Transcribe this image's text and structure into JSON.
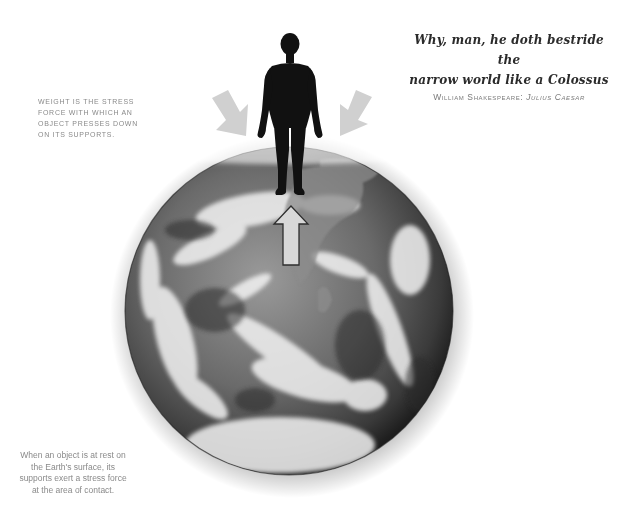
{
  "quote": {
    "line1": "Why, man, he doth bestride the",
    "line2": "narrow world like a Colossus",
    "author": "William Shakespeare:",
    "work": "Julius Caesar"
  },
  "captions": {
    "weight": "Weight is the stress force with which an object presses down on its supports.",
    "support": "When an object is at rest on the Earth's surface, its supports exert a stress force at the area of contact."
  },
  "illustration": {
    "figure": "human-silhouette",
    "globe": "earth-globe",
    "arrows": {
      "downward_left": "weight-arrow",
      "downward_right": "weight-arrow",
      "upward": "support-force-arrow"
    },
    "colors": {
      "arrow_fill": "#d0d0d0",
      "arrow_outline": "#3a3a3a",
      "silhouette": "#111111",
      "text_gray": "#8a8a8a",
      "quote_text": "#2b2b2b"
    }
  }
}
